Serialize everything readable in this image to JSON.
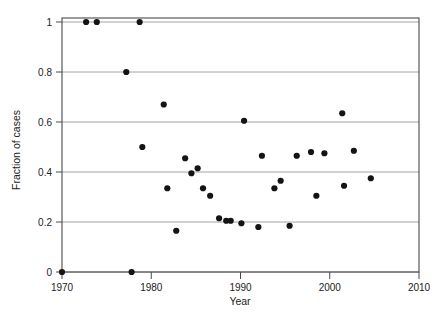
{
  "chart_data": {
    "type": "scatter",
    "title": "",
    "xlabel": "Year",
    "ylabel": "Fraction of cases",
    "xlim": [
      1970,
      2010
    ],
    "ylim": [
      0,
      1
    ],
    "xticks": [
      1970,
      1980,
      1990,
      2000,
      2010
    ],
    "xticklabels": [
      "1970",
      "1980",
      "1990",
      "2000",
      "2010"
    ],
    "yticks": [
      0,
      0.2,
      0.4,
      0.6,
      0.8,
      1
    ],
    "yticklabels": [
      "0",
      "0.2",
      "0.4",
      "0.6",
      "0.8",
      "1"
    ],
    "grid": "horizontal",
    "legend": "none",
    "marker": "filled-circle",
    "marker_color": "#141414",
    "points": [
      {
        "x": 1970.0,
        "y": 0.0
      },
      {
        "x": 1972.7,
        "y": 1.0
      },
      {
        "x": 1973.9,
        "y": 1.0
      },
      {
        "x": 1977.2,
        "y": 0.8
      },
      {
        "x": 1977.8,
        "y": 0.0
      },
      {
        "x": 1978.7,
        "y": 1.0
      },
      {
        "x": 1979.0,
        "y": 0.5
      },
      {
        "x": 1981.4,
        "y": 0.67
      },
      {
        "x": 1981.8,
        "y": 0.335
      },
      {
        "x": 1982.8,
        "y": 0.165
      },
      {
        "x": 1983.8,
        "y": 0.455
      },
      {
        "x": 1984.5,
        "y": 0.395
      },
      {
        "x": 1985.2,
        "y": 0.415
      },
      {
        "x": 1985.8,
        "y": 0.335
      },
      {
        "x": 1986.6,
        "y": 0.305
      },
      {
        "x": 1987.6,
        "y": 0.215
      },
      {
        "x": 1988.4,
        "y": 0.205
      },
      {
        "x": 1988.9,
        "y": 0.205
      },
      {
        "x": 1990.1,
        "y": 0.195
      },
      {
        "x": 1990.4,
        "y": 0.605
      },
      {
        "x": 1992.0,
        "y": 0.18
      },
      {
        "x": 1992.4,
        "y": 0.465
      },
      {
        "x": 1993.8,
        "y": 0.335
      },
      {
        "x": 1994.5,
        "y": 0.365
      },
      {
        "x": 1995.5,
        "y": 0.185
      },
      {
        "x": 1996.3,
        "y": 0.465
      },
      {
        "x": 1997.9,
        "y": 0.48
      },
      {
        "x": 1998.5,
        "y": 0.305
      },
      {
        "x": 1999.4,
        "y": 0.475
      },
      {
        "x": 2001.4,
        "y": 0.635
      },
      {
        "x": 2001.6,
        "y": 0.345
      },
      {
        "x": 2002.7,
        "y": 0.485
      },
      {
        "x": 2004.6,
        "y": 0.375
      }
    ]
  }
}
